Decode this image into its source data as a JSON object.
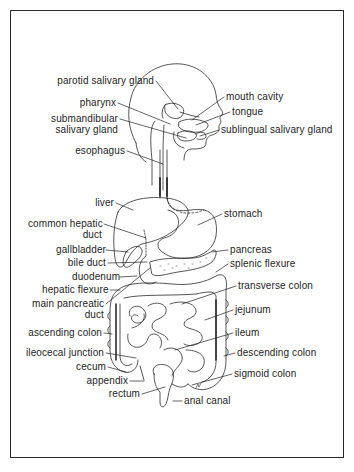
{
  "diagram": {
    "labels": [
      {
        "id": "parotid-salivary-gland",
        "text": [
          "parotid salivary gland"
        ],
        "x": 26,
        "y": 75,
        "align": "right",
        "w": 128,
        "target": [
          178,
          109
        ]
      },
      {
        "id": "mouth-cavity",
        "text": [
          "mouth cavity"
        ],
        "x": 226,
        "y": 91,
        "align": "left",
        "w": 90,
        "target": [
          192,
          120
        ]
      },
      {
        "id": "pharynx",
        "text": [
          "pharynx"
        ],
        "x": 60,
        "y": 97,
        "align": "right",
        "w": 56,
        "target": [
          170,
          124
        ]
      },
      {
        "id": "tongue",
        "text": [
          "tongue"
        ],
        "x": 232,
        "y": 106,
        "align": "left",
        "w": 60,
        "target": [
          196,
          125
        ]
      },
      {
        "id": "submandibular-salivary-gland",
        "text": [
          "submandibular",
          "salivary gland"
        ],
        "x": 40,
        "y": 113,
        "align": "right",
        "w": 78,
        "target": [
          186,
          138
        ]
      },
      {
        "id": "sublingual-salivary-gland",
        "text": [
          "sublingual salivary gland"
        ],
        "x": 221,
        "y": 124,
        "align": "left",
        "w": 120,
        "target": [
          200,
          136
        ]
      },
      {
        "id": "esophagus",
        "text": [
          "esophagus"
        ],
        "x": 70,
        "y": 145,
        "align": "right",
        "w": 55,
        "target": [
          163,
          164
        ]
      },
      {
        "id": "liver",
        "text": [
          "liver"
        ],
        "x": 92,
        "y": 197,
        "align": "right",
        "w": 22,
        "target": [
          133,
          210
        ]
      },
      {
        "id": "stomach",
        "text": [
          "stomach"
        ],
        "x": 224,
        "y": 208,
        "align": "left",
        "w": 50,
        "target": [
          198,
          225
        ]
      },
      {
        "id": "common-hepatic-duct",
        "text": [
          "common hepatic",
          "duct"
        ],
        "x": 28,
        "y": 218,
        "align": "right",
        "w": 74,
        "target": [
          146,
          238
        ]
      },
      {
        "id": "gallbladder",
        "text": [
          "gallbladder"
        ],
        "x": 56,
        "y": 244,
        "align": "right",
        "w": 48,
        "target": [
          128,
          252
        ]
      },
      {
        "id": "pancreas",
        "text": [
          "pancreas"
        ],
        "x": 230,
        "y": 244,
        "align": "left",
        "w": 50,
        "target": [
          212,
          252
        ]
      },
      {
        "id": "bile-duct",
        "text": [
          "bile duct"
        ],
        "x": 66,
        "y": 257,
        "align": "right",
        "w": 40,
        "target": [
          147,
          262
        ]
      },
      {
        "id": "splenic-flexure",
        "text": [
          "splenic flexure"
        ],
        "x": 230,
        "y": 258,
        "align": "left",
        "w": 76,
        "target": [
          216,
          272
        ]
      },
      {
        "id": "duodenum",
        "text": [
          "duodenum"
        ],
        "x": 72,
        "y": 271,
        "align": "right",
        "w": 46,
        "target": [
          137,
          276
        ]
      },
      {
        "id": "hepatic-flexure",
        "text": [
          "hepatic flexure"
        ],
        "x": 42,
        "y": 284,
        "align": "right",
        "w": 66,
        "target": [
          120,
          290
        ]
      },
      {
        "id": "transverse-colon",
        "text": [
          "transverse colon"
        ],
        "x": 238,
        "y": 280,
        "align": "left",
        "w": 90,
        "target": [
          182,
          304
        ]
      },
      {
        "id": "main-pancreatic-duct",
        "text": [
          "main pancreatic",
          "duct"
        ],
        "x": 32,
        "y": 298,
        "align": "right",
        "w": 72,
        "target": [
          150,
          268
        ]
      },
      {
        "id": "jejunum",
        "text": [
          "jejunum"
        ],
        "x": 235,
        "y": 304,
        "align": "left",
        "w": 46,
        "target": [
          205,
          320
        ]
      },
      {
        "id": "ascending-colon",
        "text": [
          "ascending colon"
        ],
        "x": 28,
        "y": 327,
        "align": "right",
        "w": 74,
        "target": [
          112,
          334
        ]
      },
      {
        "id": "ileum",
        "text": [
          "ileum"
        ],
        "x": 235,
        "y": 327,
        "align": "left",
        "w": 30,
        "target": [
          175,
          350
        ]
      },
      {
        "id": "ileocecal-junction",
        "text": [
          "ileocecal junction"
        ],
        "x": 26,
        "y": 347,
        "align": "right",
        "w": 78,
        "target": [
          136,
          358
        ]
      },
      {
        "id": "descending-colon",
        "text": [
          "descending colon"
        ],
        "x": 237,
        "y": 347,
        "align": "left",
        "w": 90,
        "target": [
          224,
          356
        ]
      },
      {
        "id": "cecum",
        "text": [
          "cecum"
        ],
        "x": 76,
        "y": 361,
        "align": "right",
        "w": 30,
        "target": [
          126,
          372
        ]
      },
      {
        "id": "sigmoid-colon",
        "text": [
          "sigmoid colon"
        ],
        "x": 234,
        "y": 368,
        "align": "left",
        "w": 70,
        "target": [
          192,
          385
        ]
      },
      {
        "id": "appendix",
        "text": [
          "appendix"
        ],
        "x": 86,
        "y": 375,
        "align": "right",
        "w": 42,
        "target": [
          144,
          381
        ]
      },
      {
        "id": "rectum",
        "text": [
          "rectum"
        ],
        "x": 108,
        "y": 388,
        "align": "right",
        "w": 32,
        "target": [
          165,
          387
        ]
      },
      {
        "id": "anal-canal",
        "text": [
          "anal canal"
        ],
        "x": 184,
        "y": 395,
        "align": "left",
        "w": 56,
        "target": [
          173,
          401
        ]
      }
    ]
  }
}
